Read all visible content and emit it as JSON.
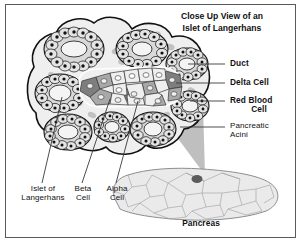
{
  "figure": {
    "title_line1": "Close Up View of an",
    "title_line2": "Islet of Langerhans",
    "frame_color": "#5a5a5a",
    "background": "#ffffff"
  },
  "callouts_right": [
    {
      "name": "duct",
      "label": "Duct",
      "style": "bold",
      "lines": [
        "Duct"
      ]
    },
    {
      "name": "delta-cell",
      "label": "Delta Cell",
      "style": "bold",
      "lines": [
        "Delta Cell"
      ]
    },
    {
      "name": "red-blood-cell",
      "label": "Red Blood Cell",
      "style": "bold",
      "lines": [
        "Red Blood",
        "Cell"
      ]
    },
    {
      "name": "pancreatic-acini",
      "label": "Pancreatic Acini",
      "style": "regular",
      "lines": [
        "Pancreatic",
        "Acini"
      ]
    }
  ],
  "callouts_bottom": [
    {
      "name": "islet-of-langerhans",
      "label": "Islet of Langerhans",
      "style": "regular",
      "lines": [
        "Islet of",
        "Langerhans"
      ]
    },
    {
      "name": "beta-cell",
      "label": "Beta Cell",
      "style": "regular",
      "lines": [
        "Beta",
        "Cell"
      ]
    },
    {
      "name": "alpha-cell",
      "label": "Alpha Cell",
      "style": "regular",
      "lines": [
        "Alpha",
        "Cell"
      ]
    }
  ],
  "organ": {
    "name": "Pancreas",
    "caption": "Pancreas",
    "islet_marker_color": "#5c5c5c"
  },
  "colors": {
    "tissue_fill": "#efefef",
    "tissue_outline": "#111111",
    "acinus_fill": "#d8d8d8",
    "acinus_cell": "#e4e4e4",
    "nucleus": "#111111",
    "beta_cell": "#efefef",
    "alpha_cell": "#a8a8a8",
    "delta_cell": "#7e7e7e",
    "red_blood_cell": "#c2c2c2",
    "wedge": "#b4b4b4",
    "organ_fill": "#eaeaea",
    "organ_outline": "#8d8d8d",
    "leader_line": "#3a3a3a"
  }
}
